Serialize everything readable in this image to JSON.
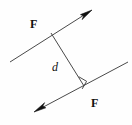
{
  "figure": {
    "background_color": "#fefefe",
    "stroke_color": "#4a4a4a",
    "arrow_fill_color": "#111111",
    "text_color": "#111111"
  },
  "labels": {
    "force_top": "F",
    "force_bottom": "F",
    "distance": "d"
  },
  "icons": {
    "right_angle": "right-angle-marker",
    "arrowhead_top": "arrowhead-up-right",
    "arrowhead_bottom": "arrowhead-down-left"
  },
  "geometry": {
    "force_line_top": {
      "x1": 10,
      "y1": 62,
      "x2": 92,
      "y2": 10
    },
    "force_line_bottom": {
      "x1": 34,
      "y1": 112,
      "x2": 128,
      "y2": 62
    },
    "distance_line": {
      "x1": 51,
      "y1": 33,
      "x2": 84,
      "y2": 86
    },
    "right_angle_marker": {
      "x": 84,
      "y": 86,
      "size": 8
    },
    "arrow_top_tip": {
      "x": 92,
      "y": 10
    },
    "arrow_bottom_tip": {
      "x": 34,
      "y": 112
    }
  }
}
